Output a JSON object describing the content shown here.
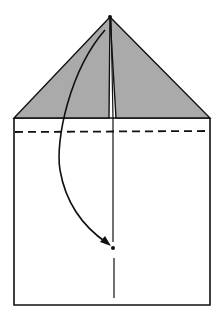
{
  "diagram": {
    "type": "origami-fold-step",
    "colors": {
      "background": "#ffffff",
      "flap_fill": "#aaaaaa",
      "line": "#111111"
    },
    "elements": {
      "paper_body": "paper-rectangle",
      "left_flap": "left-triangle-flap",
      "right_flap": "right-triangle-flap",
      "fold_line": "dashed-valley-fold-line",
      "center_crease": "vertical-center-crease",
      "arrow": "fold-direction-arrow",
      "start_point": "apex-dot",
      "target_point": "target-dot"
    }
  }
}
